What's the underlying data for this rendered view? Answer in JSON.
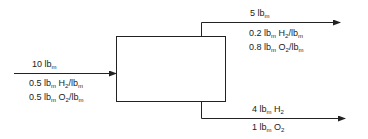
{
  "diagram": {
    "type": "process-flow-mass-balance",
    "unit": {
      "shape": "rectangle",
      "label": ""
    },
    "streams": {
      "input": {
        "direction": "in",
        "labels": [
          {
            "num": "10",
            "unit": "lb",
            "unit_sub": "m",
            "species": "",
            "species_sub": "",
            "suffix": "",
            "suffix_sub": ""
          },
          {
            "num": "0.5",
            "unit": "lb",
            "unit_sub": "m",
            "species": "H",
            "species_sub": "2",
            "suffix": "/lb",
            "suffix_sub": "m"
          },
          {
            "num": "0.5",
            "unit": "lb",
            "unit_sub": "m",
            "species": "O",
            "species_sub": "2",
            "suffix": "/lb",
            "suffix_sub": "m"
          }
        ]
      },
      "top_output": {
        "direction": "out",
        "labels": [
          {
            "num": "5",
            "unit": "lb",
            "unit_sub": "m",
            "species": "",
            "species_sub": "",
            "suffix": "",
            "suffix_sub": ""
          },
          {
            "num": "0.2",
            "unit": "lb",
            "unit_sub": "m",
            "species": "H",
            "species_sub": "2",
            "suffix": "/lb",
            "suffix_sub": "m"
          },
          {
            "num": "0.8",
            "unit": "lb",
            "unit_sub": "m",
            "species": "O",
            "species_sub": "2",
            "suffix": "/lb",
            "suffix_sub": "m"
          }
        ]
      },
      "bottom_output": {
        "direction": "out",
        "labels": [
          {
            "num": "4",
            "unit": "lb",
            "unit_sub": "m",
            "species": "H",
            "species_sub": "2",
            "suffix": "",
            "suffix_sub": ""
          },
          {
            "num": "1",
            "unit": "lb",
            "unit_sub": "m",
            "species": "O",
            "species_sub": "2",
            "suffix": "",
            "suffix_sub": ""
          }
        ]
      }
    },
    "colors": {
      "line": "#222222",
      "text": "#222222",
      "background": "#ffffff"
    }
  }
}
